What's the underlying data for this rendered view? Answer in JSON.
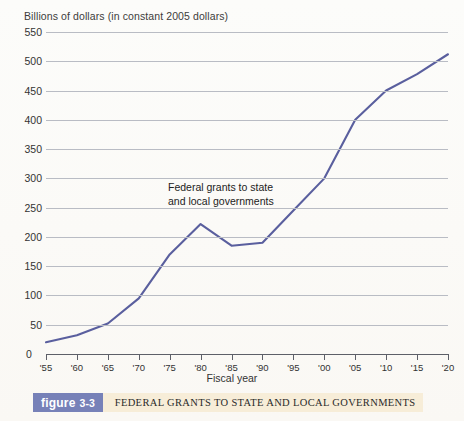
{
  "chart_data": {
    "type": "line",
    "title": "FEDERAL GRANTS TO STATE AND LOCAL GOVERNMENTS",
    "figure_label_word": "figure",
    "figure_label_number": "3-3",
    "ylabel": "Billions of dollars (in constant 2005 dollars)",
    "xlabel": "Fiscal year",
    "grid": true,
    "legend_position": "none",
    "annotation": "Federal grants to state\nand local governments",
    "line_color": "#5a5f9e",
    "gridline_color": "#b9bcc4",
    "axis_color": "#5d5f68",
    "badge_color": "#7781b8",
    "strip_color": "#f7edd8",
    "ylim": [
      0,
      550
    ],
    "xlim": [
      1955,
      2020
    ],
    "ytick_labels": [
      "550",
      "500",
      "450",
      "400",
      "350",
      "300",
      "250",
      "200",
      "150",
      "100",
      "50",
      "0"
    ],
    "ytick_values": [
      550,
      500,
      450,
      400,
      350,
      300,
      250,
      200,
      150,
      100,
      50,
      0
    ],
    "xtick_labels": [
      "'55",
      "'60",
      "'65",
      "'70",
      "'75",
      "'80",
      "'85",
      "'90",
      "'95",
      "'00",
      "'05",
      "'10",
      "'15",
      "'20"
    ],
    "xtick_values": [
      1955,
      1960,
      1965,
      1970,
      1975,
      1980,
      1985,
      1990,
      1995,
      2000,
      2005,
      2010,
      2015,
      2020
    ],
    "x": [
      1955,
      1960,
      1965,
      1970,
      1975,
      1980,
      1985,
      1990,
      1995,
      2000,
      2005,
      2010,
      2015,
      2020
    ],
    "values": [
      20,
      32,
      52,
      95,
      170,
      222,
      185,
      190,
      245,
      300,
      400,
      450,
      478,
      512
    ],
    "series": [
      {
        "name": "Federal grants to state and local governments",
        "values": [
          20,
          32,
          52,
          95,
          170,
          222,
          185,
          190,
          245,
          300,
          400,
          450,
          478,
          512
        ]
      }
    ]
  }
}
